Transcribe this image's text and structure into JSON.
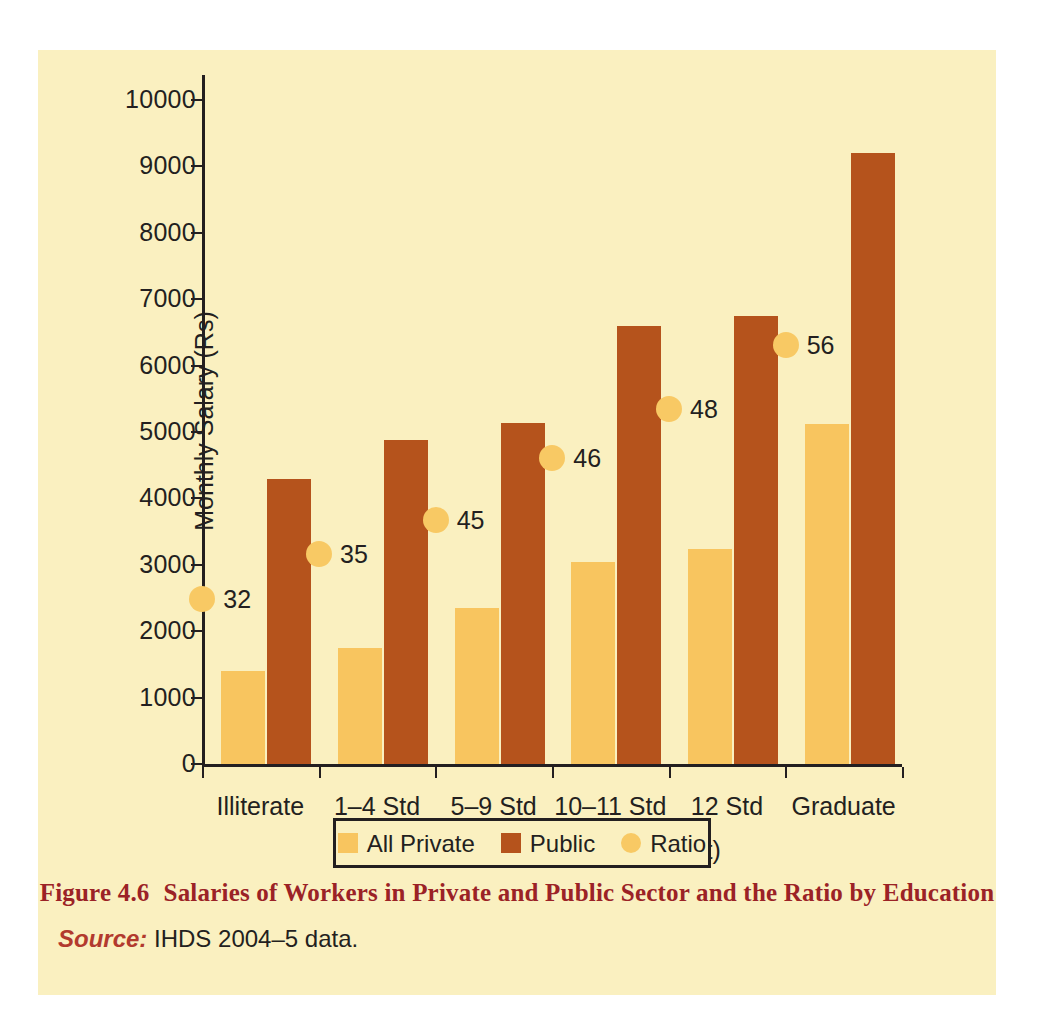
{
  "figure": {
    "caption_number": "Figure 4.6",
    "caption_text": "Salaries of Workers in Private and Public Sector and the Ratio by Education",
    "source_label": "Source:",
    "source_text": " IHDS 2004–5 data."
  },
  "colors": {
    "page_background": "#ffffff",
    "panel_background": "#faf0c0",
    "private_bar": "#f8c55f",
    "public_bar": "#b5531c",
    "ratio_dot": "#f8c964",
    "axis": "#231f20",
    "caption": "#9b2226",
    "source_label": "#b23a2e"
  },
  "chart_data": {
    "type": "bar",
    "title": "Salaries of Workers in Private and Public Sector and the Ratio by Education",
    "xlabel": "Educational Level (in per cent)",
    "ylabel": "Monthly Salary (Rs)",
    "ylim": [
      0,
      10000
    ],
    "yticks": [
      0,
      1000,
      2000,
      3000,
      4000,
      5000,
      6000,
      7000,
      8000,
      9000,
      10000
    ],
    "ytick_labels": [
      "0",
      "1000",
      "2000",
      "3000",
      "4000",
      "5000",
      "6000",
      "7000",
      "8000",
      "9000",
      "10000"
    ],
    "grid": false,
    "legend_position": "bottom",
    "categories": [
      "Illiterate",
      "1–4 Std",
      "5–9 Std",
      "10–11 Std",
      "12 Std",
      "Graduate"
    ],
    "series": [
      {
        "name": "All Private",
        "type": "bar",
        "color": "#f8c55f",
        "values": [
          1350,
          1700,
          2310,
          3000,
          3200,
          5080
        ]
      },
      {
        "name": "Public",
        "type": "bar",
        "color": "#b5531c",
        "values": [
          4250,
          4830,
          5090,
          6550,
          6700,
          9150
        ]
      },
      {
        "name": "Ratio",
        "type": "marker",
        "color": "#f8c964",
        "values": [
          32,
          35,
          45,
          46,
          48,
          56
        ],
        "marker_y_positions": [
          2490,
          3160,
          3680,
          4610,
          5350,
          6310
        ],
        "labels": [
          "32",
          "35",
          "45",
          "46",
          "48",
          "56"
        ]
      }
    ]
  },
  "legend": {
    "items": [
      {
        "label": "All Private",
        "shape": "square",
        "color": "#f8c55f"
      },
      {
        "label": "Public",
        "shape": "square",
        "color": "#b5531c"
      },
      {
        "label": "Ratio",
        "shape": "circle",
        "color": "#f8c964"
      }
    ]
  }
}
